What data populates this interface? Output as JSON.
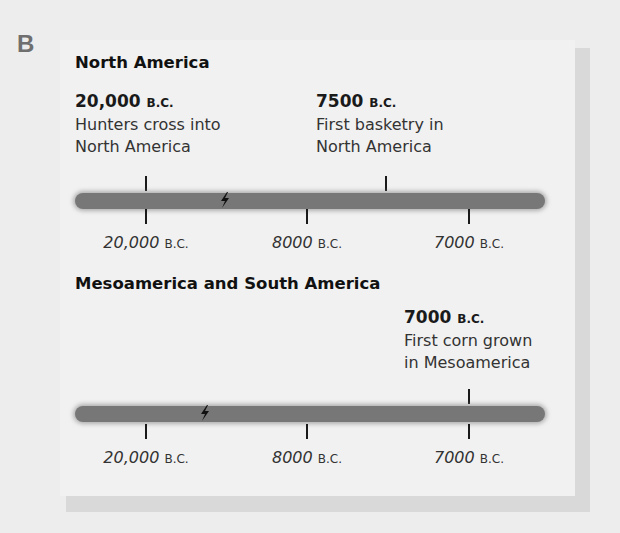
{
  "section_letter": "B",
  "colors": {
    "background": "#ededed",
    "panel": "#f1f1f1",
    "panel_shadow": "#d9d9d9",
    "timeline_bar": "#777777",
    "text": "#1a1a1a",
    "section_letter": "#6f6f6f"
  },
  "timelines": [
    {
      "title": "North America",
      "events": [
        {
          "year": "20,000",
          "era": "B.C.",
          "line1": "Hunters cross into",
          "line2": "North America",
          "position": "above"
        },
        {
          "year": "7500",
          "era": "B.C.",
          "line1": "First basketry in",
          "line2": "North America",
          "position": "above"
        }
      ],
      "axis_labels": [
        {
          "year": "20,000",
          "era": "B.C."
        },
        {
          "year": "8000",
          "era": "B.C."
        },
        {
          "year": "7000",
          "era": "B.C."
        }
      ],
      "break_icon": "axis-break-icon"
    },
    {
      "title": "Mesoamerica and South America",
      "events": [
        {
          "year": "7000",
          "era": "B.C.",
          "line1": "First corn grown",
          "line2": "in Mesoamerica",
          "position": "above"
        }
      ],
      "axis_labels": [
        {
          "year": "20,000",
          "era": "B.C."
        },
        {
          "year": "8000",
          "era": "B.C."
        },
        {
          "year": "7000",
          "era": "B.C."
        }
      ],
      "break_icon": "axis-break-icon"
    }
  ]
}
